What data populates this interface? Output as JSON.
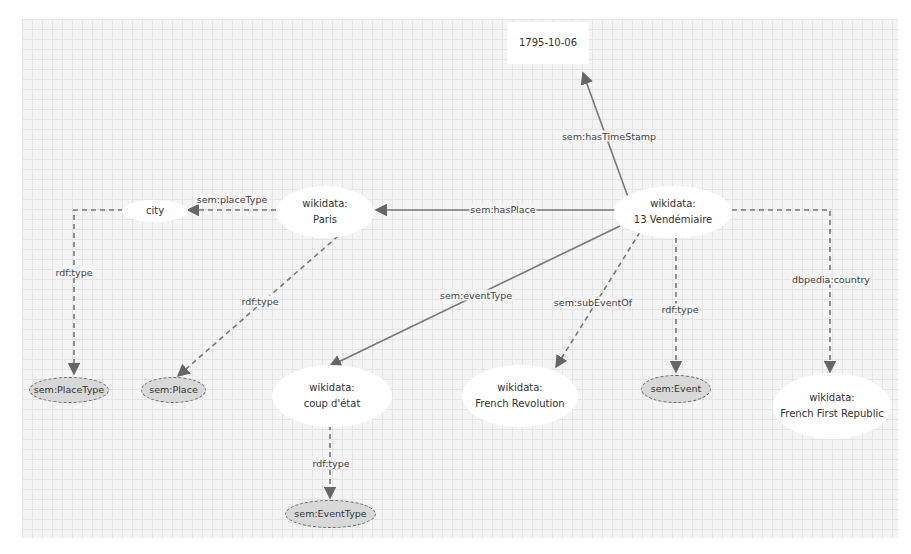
{
  "diagram": {
    "nodes": {
      "timestamp": {
        "label": "1795-10-06",
        "kind": "literal"
      },
      "event": {
        "prefix": "wikidata:",
        "name": "13 Vendémiaire",
        "kind": "resource"
      },
      "paris": {
        "prefix": "wikidata:",
        "name": "Paris",
        "kind": "resource"
      },
      "city": {
        "label": "city",
        "kind": "resource"
      },
      "coup": {
        "prefix": "wikidata:",
        "name": "coup d'état",
        "kind": "resource"
      },
      "revolution": {
        "prefix": "wikidata:",
        "name": "French Revolution",
        "kind": "resource"
      },
      "republic": {
        "prefix": "wikidata:",
        "name": "French First Republic",
        "kind": "resource"
      },
      "placeType": {
        "label": "sem:PlaceType",
        "kind": "class"
      },
      "place": {
        "label": "sem:Place",
        "kind": "class"
      },
      "semEvent": {
        "label": "sem:Event",
        "kind": "class"
      },
      "eventType": {
        "label": "sem:EventType",
        "kind": "class"
      }
    },
    "edges": [
      {
        "id": "hasTimeStamp",
        "label": "sem:hasTimeStamp",
        "from": "event",
        "to": "timestamp",
        "style": "solid"
      },
      {
        "id": "hasPlace",
        "label": "sem:hasPlace",
        "from": "event",
        "to": "paris",
        "style": "solid"
      },
      {
        "id": "placeType",
        "label": "sem:placeType",
        "from": "paris",
        "to": "city",
        "style": "dashed"
      },
      {
        "id": "cityType",
        "label": "rdf:type",
        "from": "city",
        "to": "placeType",
        "style": "dashed"
      },
      {
        "id": "parisType",
        "label": "rdf:type",
        "from": "paris",
        "to": "place",
        "style": "dashed"
      },
      {
        "id": "eventTypeEdge",
        "label": "sem:eventType",
        "from": "event",
        "to": "coup",
        "style": "solid"
      },
      {
        "id": "subEventOf",
        "label": "sem:subEventOf",
        "from": "event",
        "to": "revolution",
        "style": "dashed"
      },
      {
        "id": "eventRdfType",
        "label": "rdf:type",
        "from": "event",
        "to": "semEvent",
        "style": "dashed"
      },
      {
        "id": "country",
        "label": "dbpedia:country",
        "from": "event",
        "to": "republic",
        "style": "dashed"
      },
      {
        "id": "coupType",
        "label": "rdf:type",
        "from": "coup",
        "to": "eventType",
        "style": "dashed"
      }
    ],
    "colors": {
      "canvas": "#f4f4f4",
      "grid": "#e4e4e4",
      "edge": "#666666",
      "class_fill": "#d8d8d8",
      "resource_fill": "#ffffff"
    }
  }
}
